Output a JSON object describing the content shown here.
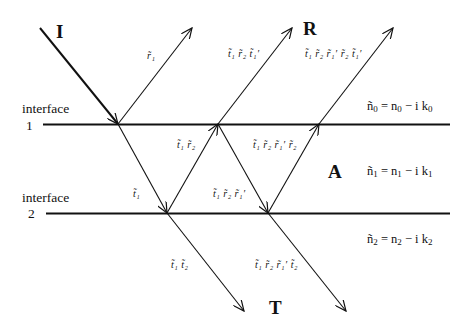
{
  "labels": {
    "incident": "I",
    "reflected": "R",
    "absorbed": "A",
    "transmitted": "T"
  },
  "interfaces": [
    {
      "label": "interface",
      "number": "1"
    },
    {
      "label": "interface",
      "number": "2"
    }
  ],
  "media": [
    {
      "n": "ñ",
      "sub": "0",
      "eq": " = n",
      "sub2": "0",
      "mid": " − i k",
      "sub3": "0"
    },
    {
      "n": "ñ",
      "sub": "1",
      "eq": " = n",
      "sub2": "1",
      "mid": " − i k",
      "sub3": "1"
    },
    {
      "n": "ñ",
      "sub": "2",
      "eq": " = n",
      "sub2": "2",
      "mid": " − i k",
      "sub3": "2"
    }
  ],
  "coefficients": {
    "r1": "r̃₁",
    "t1_r2_t1p": "t̃₁ r̃₂ t̃₁′",
    "t1_r2_r1p_r2_t1p": "t̃₁ r̃₂ r̃₁′ r̃₂ t̃₁′",
    "t1_r2": "t̃₁ r̃₂",
    "t1_r2_r1p_r2": "t̃₁ r̃₂ r̃₁′ r̃₂",
    "t1": "t̃₁",
    "t1_r2_r1p": "t̃₁ r̃₂ r̃₁′",
    "t1_t2": "t̃₁ t̃₂",
    "t1_r2_r1p_t2": "t̃₁ r̃₂ r̃₁′ t̃₂"
  },
  "colors": {
    "ink": "#111111",
    "background": "#ffffff"
  }
}
